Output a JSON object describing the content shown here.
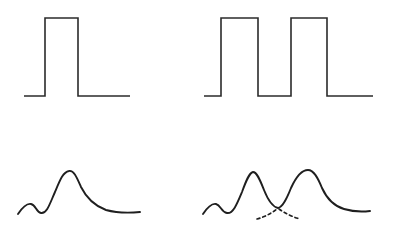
{
  "figure": {
    "background_color": "#ffffff",
    "stroke_color": "#2b2b2b",
    "stroke_color_curve": "#1f1f1f",
    "stroke_width_pulse": 1.6,
    "stroke_width_curve": 1.9,
    "stroke_width_marker": 1.6,
    "width": 397,
    "height": 237,
    "panel_count": 4,
    "layout": "2x2 grid, no axes, no labels, no gridlines"
  },
  "panels": [
    {
      "id": "top-left",
      "name": "single-square-pulse",
      "description": "One rectangular pulse on a flat baseline",
      "pulse_count": 1,
      "baseline_y": 96,
      "top_y": 18,
      "amplitude": 78,
      "x_start": 24,
      "x_end": 130,
      "pulses": [
        {
          "rise_x": 45,
          "fall_x": 78,
          "width": 33
        }
      ],
      "path": "M 24 96 L 45 96 L 45 18 L 78 18 L 78 96 L 130 96"
    },
    {
      "id": "top-right",
      "name": "double-square-pulse",
      "description": "Two rectangular pulses on a flat baseline",
      "pulse_count": 2,
      "baseline_y": 96,
      "top_y": 18,
      "amplitude": 78,
      "x_start": 204,
      "x_end": 373,
      "pulses": [
        {
          "rise_x": 221,
          "fall_x": 258,
          "width": 37
        },
        {
          "rise_x": 291,
          "fall_x": 327,
          "width": 36
        }
      ],
      "gap_width": 33,
      "path": "M 204 96 L 221 96 L 221 18 L 258 18 L 258 96 L 291 96 L 291 18 L 327 18 L 327 96 L 373 96"
    },
    {
      "id": "bottom-left",
      "name": "single-peak-response",
      "description": "Smooth response curve with small leading ripple and one main peak decaying to a flat tail",
      "peak_count": 1,
      "baseline_y": 213,
      "ripple": {
        "x": 32,
        "y": 205,
        "height": 8
      },
      "peaks": [
        {
          "x": 68,
          "y": 171,
          "height": 42
        }
      ],
      "x_start": 18,
      "x_end": 140,
      "path": "M 18 214 C 22 208 26 203 31 204 C 36 205 36 212 41 213 C 47 214 50 203 55 192 C 60 180 63 172 69 171 C 74 170 77 178 81 187 C 87 199 95 206 106 210 C 117 213 129 213 140 212"
    },
    {
      "id": "bottom-right",
      "name": "double-peak-response",
      "description": "Smooth response curve with small leading ripple and two main peaks separated by a sharp valley, with a dashed marker beneath the valley",
      "peak_count": 2,
      "baseline_y": 213,
      "ripple": {
        "x": 216,
        "y": 205,
        "height": 8
      },
      "peaks": [
        {
          "x": 251,
          "y": 172,
          "height": 41
        },
        {
          "x": 308,
          "y": 170,
          "height": 43
        }
      ],
      "valley": {
        "x": 278,
        "y": 208,
        "depth": 38
      },
      "x_start": 203,
      "x_end": 370,
      "path": "M 203 214 C 207 208 211 203 216 204 C 221 205 221 212 227 213 C 233 214 237 204 242 192 C 246 181 249 173 253 172 C 257 172 260 180 264 190 C 268 200 273 207 278 208 C 283 207 287 198 291 188 C 296 177 301 170 308 170 C 314 170 318 178 322 188 C 327 199 334 206 344 209 C 354 212 362 212 370 211",
      "marker": {
        "name": "dashed-valley-marker",
        "style": "dashed",
        "shape": "inverted-v converging at valley",
        "apex_x": 278,
        "apex_y": 209,
        "left_x": 257,
        "left_y": 219,
        "right_x": 299,
        "right_y": 219,
        "dash_pattern": "3,3",
        "path_left": "M 257 219 Q 268 216 277 209",
        "path_right": "M 279 209 Q 289 216 300 219"
      }
    }
  ]
}
